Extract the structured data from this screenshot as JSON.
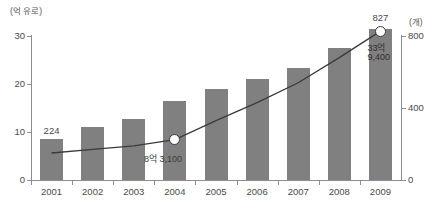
{
  "chart_data": {
    "type": "bar",
    "title": "",
    "subtitle": "",
    "xlabel": "",
    "ylabel": "(억 유로)",
    "y2label": "(개)",
    "categories": [
      "2001",
      "2002",
      "2003",
      "2004",
      "2005",
      "2006",
      "2007",
      "2008",
      "2009"
    ],
    "ylim": [
      0,
      30
    ],
    "y2lim": [
      0,
      800
    ],
    "yticks": [
      "0",
      "10",
      "20",
      "30"
    ],
    "ytick_values": [
      0,
      10,
      20,
      30
    ],
    "y2ticks": [
      "0",
      "400",
      "800"
    ],
    "y2tick_values": [
      0,
      400,
      800
    ],
    "grid": false,
    "legend": "none",
    "series": [
      {
        "name": "매출액",
        "type": "bar",
        "axis": "left",
        "unit": "억 유로",
        "color": "#808080",
        "values": [
          8.6,
          11.0,
          12.8,
          16.4,
          19.0,
          21.0,
          23.3,
          27.6,
          31.5
        ]
      },
      {
        "name": "업체수",
        "type": "line",
        "axis": "right",
        "unit": "개",
        "color": "#3a3a3a",
        "values": [
          150,
          170,
          190,
          224,
          330,
          430,
          540,
          680,
          827
        ]
      }
    ],
    "data_labels": [
      {
        "category": "2001",
        "series": "업체수",
        "text": "224",
        "value": 224
      },
      {
        "category": "2009",
        "series": "업체수",
        "text": "827",
        "value": 827
      }
    ],
    "annotations": [
      {
        "category": "2004",
        "text": "8억 3,100",
        "series": "매출액"
      },
      {
        "category": "2009",
        "text": "33억",
        "series": "매출액"
      },
      {
        "category": "2009",
        "text": "9,400",
        "series": "매출액"
      }
    ],
    "markers": [
      {
        "category": "2004",
        "shape": "circle",
        "fill": "#ffffff",
        "stroke": "#3a3a3a"
      },
      {
        "category": "2009",
        "shape": "circle",
        "fill": "#ffffff",
        "stroke": "#3a3a3a"
      }
    ]
  }
}
